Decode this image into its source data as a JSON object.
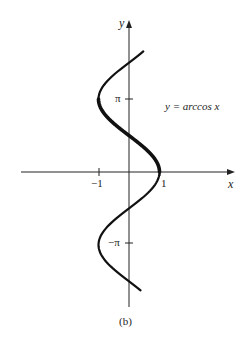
{
  "chart_data": {
    "type": "line",
    "title": "",
    "caption": "(b)",
    "xlabel": "x",
    "ylabel": "y",
    "annotation": "y = arccos x",
    "x_ticks": [
      {
        "value": -1,
        "label": "−1"
      },
      {
        "value": 1,
        "label": "1"
      }
    ],
    "y_ticks": [
      {
        "value": 3.14159,
        "label": "π"
      },
      {
        "value": -3.14159,
        "label": "−π"
      }
    ],
    "xlim": [
      -3.5,
      3.5
    ],
    "ylim": [
      -5.8,
      6.6
    ],
    "grid": false,
    "series": [
      {
        "name": "x = cos y",
        "relation": "x = cos(y)",
        "y_range": [
          -5.1,
          5.2
        ],
        "style": "thin"
      },
      {
        "name": "y = arccos x",
        "relation": "x = cos(y)",
        "y_range": [
          0,
          3.14159
        ],
        "style": "bold"
      }
    ]
  },
  "labels": {
    "x_axis": "x",
    "y_axis": "y",
    "tick_neg1": "−1",
    "tick_pos1": "1",
    "tick_pi": "π",
    "tick_neg_pi": "−π",
    "curve_label": "y = arccos x",
    "caption": "(b)"
  },
  "colors": {
    "curve": "#111111",
    "axis": "#222222"
  }
}
